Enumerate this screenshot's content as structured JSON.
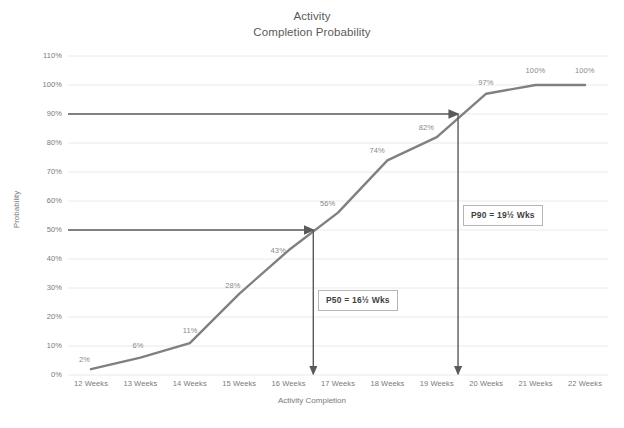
{
  "chart_data": {
    "type": "line",
    "title": "Activity",
    "subtitle": "Completion Probability",
    "xlabel": "Activity Completion",
    "ylabel": "Probability",
    "categories": [
      "12 Weeks",
      "13 Weeks",
      "14 Weeks",
      "15 Weeks",
      "16 Weeks",
      "17 Weeks",
      "18 Weeks",
      "19 Weeks",
      "20 Weeks",
      "21 Weeks",
      "22 Weeks"
    ],
    "x": [
      12,
      13,
      14,
      15,
      16,
      17,
      18,
      19,
      20,
      21,
      22
    ],
    "values": [
      2,
      6,
      11,
      28,
      43,
      56,
      74,
      82,
      97,
      100,
      100
    ],
    "point_labels": [
      "2%",
      "6%",
      "11%",
      "28%",
      "43%",
      "56%",
      "74%",
      "82%",
      "97%",
      "100%",
      "100%"
    ],
    "ylim": [
      0,
      110
    ],
    "y_ticks": [
      "0%",
      "10%",
      "20%",
      "30%",
      "40%",
      "50%",
      "60%",
      "70%",
      "80%",
      "90%",
      "100%",
      "110%"
    ],
    "y_tick_values": [
      0,
      10,
      20,
      30,
      40,
      50,
      60,
      70,
      80,
      90,
      100,
      110
    ],
    "grid": true,
    "legend": "none",
    "series_color": "#808080",
    "grid_color": "#eceaea",
    "annotation_color": "#5a5a5a",
    "annotations": [
      {
        "name": "p50",
        "label": "P50 = 16½ Wks",
        "probability": 50,
        "weeks": 16.5,
        "h_arrow_from_x": 12,
        "h_arrow_to_x": 16.5,
        "v_arrow_from_y": 50,
        "v_arrow_to_y": 0
      },
      {
        "name": "p90",
        "label": "P90 = 19½ Wks",
        "probability": 90,
        "weeks": 19.43,
        "h_arrow_from_x": 12,
        "h_arrow_to_x": 19.43,
        "v_arrow_from_y": 90,
        "v_arrow_to_y": 0
      }
    ]
  }
}
